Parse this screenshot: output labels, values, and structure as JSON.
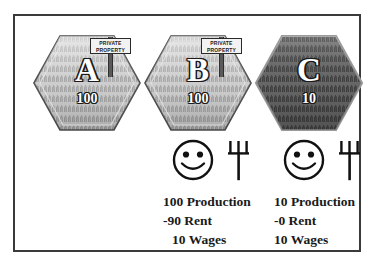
{
  "parcels": [
    {
      "id": "a",
      "letter": "A",
      "number": "100",
      "has_sign": true,
      "sign": {
        "line1": "PRIVATE",
        "line2": "PROPERTY"
      },
      "fill": "light-grass"
    },
    {
      "id": "b",
      "letter": "B",
      "number": "100",
      "has_sign": true,
      "sign": {
        "line1": "PRIVATE",
        "line2": "PROPERTY"
      },
      "fill": "light-grass"
    },
    {
      "id": "c",
      "letter": "C",
      "number": "10",
      "has_sign": false,
      "sign": {
        "line1": "",
        "line2": ""
      },
      "fill": "dark-grass"
    }
  ],
  "icons": {
    "smiley": "smiley-face-icon",
    "tool": "pitchfork-icon"
  },
  "ledgers": [
    {
      "id": "b",
      "production": "100 Production",
      "rent": "-90 Rent",
      "wages": "10 Wages"
    },
    {
      "id": "c",
      "production": "10 Production",
      "rent": "-0 Rent",
      "wages": "10 Wages"
    }
  ],
  "colors": {
    "frame_border": "#3a3a3a",
    "background": "#ffffff",
    "text": "#1a1a1a",
    "hex_outline": "#4a4a4a",
    "grass_light": "#b9b9b9",
    "grass_dark": "#616161",
    "sign_board": "#f2f2f2"
  }
}
